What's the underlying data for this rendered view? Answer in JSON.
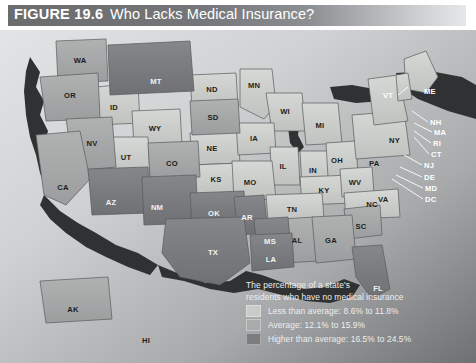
{
  "figure": {
    "number": "FIGURE 19.6",
    "title": "Who Lacks Medical Insurance?"
  },
  "legend": {
    "caption_line1": "The percentage of a state's",
    "caption_line2": "residents who have no medical insurance",
    "entries": [
      {
        "label": "Less than average: 8.6% to 11.8%",
        "color": "#c9cbc8"
      },
      {
        "label": "Average: 12.1% to 15.9%",
        "color": "#a9abab"
      },
      {
        "label": "Higher than average: 16.5% to 24.5%",
        "color": "#7b7d7e"
      }
    ]
  },
  "map": {
    "ocean_color": "#cfd1d2",
    "shadow_color": "#2f3132",
    "border_color": "#58595b",
    "states": [
      {
        "code": "WA",
        "x": 80,
        "y": 33,
        "tone": "mid"
      },
      {
        "code": "OR",
        "x": 70,
        "y": 68,
        "tone": "mid"
      },
      {
        "code": "ID",
        "x": 114,
        "y": 80,
        "tone": "light"
      },
      {
        "code": "MT",
        "x": 156,
        "y": 54,
        "tone": "dark"
      },
      {
        "code": "ND",
        "x": 212,
        "y": 62,
        "tone": "light"
      },
      {
        "code": "MN",
        "x": 254,
        "y": 58,
        "tone": "light"
      },
      {
        "code": "WI",
        "x": 285,
        "y": 84,
        "tone": "light"
      },
      {
        "code": "SD",
        "x": 213,
        "y": 90,
        "tone": "mid"
      },
      {
        "code": "WY",
        "x": 155,
        "y": 101,
        "tone": "light"
      },
      {
        "code": "NV",
        "x": 92,
        "y": 116,
        "tone": "mid"
      },
      {
        "code": "UT",
        "x": 126,
        "y": 130,
        "tone": "light"
      },
      {
        "code": "CO",
        "x": 172,
        "y": 136,
        "tone": "mid"
      },
      {
        "code": "NE",
        "x": 212,
        "y": 121,
        "tone": "light"
      },
      {
        "code": "IA",
        "x": 254,
        "y": 111,
        "tone": "light"
      },
      {
        "code": "MI",
        "x": 320,
        "y": 98,
        "tone": "light"
      },
      {
        "code": "IL",
        "x": 283,
        "y": 139,
        "tone": "light"
      },
      {
        "code": "IN",
        "x": 313,
        "y": 143,
        "tone": "light"
      },
      {
        "code": "OH",
        "x": 337,
        "y": 133,
        "tone": "light"
      },
      {
        "code": "KS",
        "x": 216,
        "y": 152,
        "tone": "light"
      },
      {
        "code": "MO",
        "x": 250,
        "y": 155,
        "tone": "light"
      },
      {
        "code": "KY",
        "x": 324,
        "y": 163,
        "tone": "light"
      },
      {
        "code": "WV",
        "x": 355,
        "y": 155,
        "tone": "light"
      },
      {
        "code": "CA",
        "x": 63,
        "y": 160,
        "tone": "mid"
      },
      {
        "code": "AZ",
        "x": 111,
        "y": 175,
        "tone": "dark"
      },
      {
        "code": "NM",
        "x": 157,
        "y": 180,
        "tone": "dark"
      },
      {
        "code": "OK",
        "x": 214,
        "y": 186,
        "tone": "dark"
      },
      {
        "code": "AR",
        "x": 247,
        "y": 190,
        "tone": "dark"
      },
      {
        "code": "TN",
        "x": 292,
        "y": 182,
        "tone": "light"
      },
      {
        "code": "NC",
        "x": 372,
        "y": 177,
        "tone": "light"
      },
      {
        "code": "SC",
        "x": 361,
        "y": 199,
        "tone": "mid"
      },
      {
        "code": "MS",
        "x": 270,
        "y": 214,
        "tone": "dark"
      },
      {
        "code": "AL",
        "x": 297,
        "y": 213,
        "tone": "mid"
      },
      {
        "code": "GA",
        "x": 331,
        "y": 213,
        "tone": "mid"
      },
      {
        "code": "LA",
        "x": 271,
        "y": 232,
        "tone": "dark"
      },
      {
        "code": "TX",
        "x": 213,
        "y": 225,
        "tone": "dark"
      },
      {
        "code": "FL",
        "x": 378,
        "y": 261,
        "tone": "dark"
      },
      {
        "code": "AK",
        "x": 73,
        "y": 282,
        "tone": "mid"
      },
      {
        "code": "HI",
        "x": 146,
        "y": 313,
        "tone": "mid"
      }
    ],
    "callouts": [
      {
        "code": "VT",
        "x": 383,
        "y": 68,
        "tone": "light"
      },
      {
        "code": "ME",
        "x": 424,
        "y": 64,
        "tone": "light"
      },
      {
        "code": "NH",
        "x": 430,
        "y": 95,
        "tone": "light"
      },
      {
        "code": "MA",
        "x": 434,
        "y": 105,
        "tone": "light"
      },
      {
        "code": "RI",
        "x": 433,
        "y": 116,
        "tone": "light"
      },
      {
        "code": "CT",
        "x": 431,
        "y": 127,
        "tone": "light"
      },
      {
        "code": "NY",
        "x": 389,
        "y": 113,
        "tone": "dark"
      },
      {
        "code": "PA",
        "x": 369,
        "y": 136,
        "tone": "dark"
      },
      {
        "code": "NJ",
        "x": 424,
        "y": 138,
        "tone": "light"
      },
      {
        "code": "DE",
        "x": 424,
        "y": 150,
        "tone": "light"
      },
      {
        "code": "MD",
        "x": 425,
        "y": 161,
        "tone": "light"
      },
      {
        "code": "DC",
        "x": 425,
        "y": 172,
        "tone": "light"
      },
      {
        "code": "VA",
        "x": 378,
        "y": 172,
        "tone": "dark"
      }
    ]
  }
}
